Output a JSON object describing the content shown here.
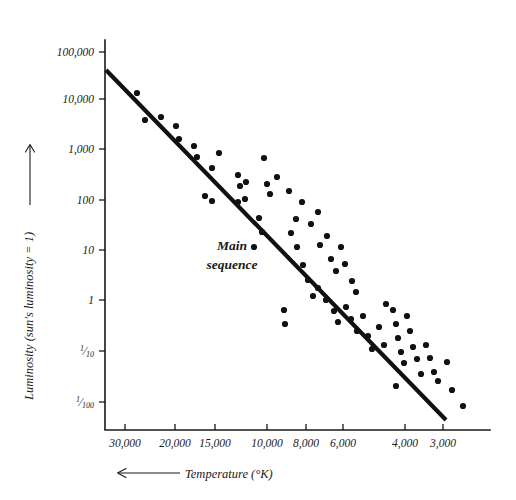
{
  "figure": {
    "background_color": "#ffffff",
    "ink_color": "#111111"
  },
  "annotations": {
    "main_sequence_line1": "Main",
    "main_sequence_line2": "sequence"
  },
  "axis_titles": {
    "y": "Luminosity (sun's luminosity = 1)",
    "x": "Temperature (°K)",
    "y_arrow": "up-arrow",
    "x_arrow": "left-arrow"
  },
  "chart_data": {
    "type": "scatter",
    "title": "",
    "xlabel": "Temperature (°K)",
    "ylabel": "Luminosity (sun's luminosity = 1)",
    "x_axis": {
      "scale": "reversed-nonlinear",
      "tick_labels": [
        "30,000",
        "20,000",
        "15,000",
        "10,000",
        "8,000",
        "6,000",
        "4,000",
        "3,000"
      ],
      "tick_values": [
        30000,
        20000,
        15000,
        10000,
        8000,
        6000,
        4000,
        3000
      ],
      "tick_px": [
        125,
        175,
        215,
        267,
        306,
        343,
        405,
        443
      ],
      "direction": "decreasing left to right",
      "range_px": [
        105,
        490
      ]
    },
    "y_axis": {
      "scale": "log10",
      "tick_labels": [
        "100,000",
        "10,000",
        "1,000",
        "100",
        "10",
        "1",
        "1/10",
        "1/100"
      ],
      "tick_values": [
        100000,
        10000,
        1000,
        100,
        10,
        1,
        0.1,
        0.01
      ],
      "tick_px": [
        52,
        99,
        149,
        200,
        250,
        300,
        351,
        402
      ],
      "range_px": [
        52,
        430
      ]
    },
    "grid": false,
    "legend": false,
    "series": [
      {
        "name": "Main sequence fit line",
        "type": "line",
        "points_px": [
          [
            106,
            70
          ],
          [
            446,
            420
          ]
        ]
      },
      {
        "name": "Stars",
        "type": "scatter",
        "marker": "filled-circle",
        "marker_radius_px": 3.1,
        "points_px": [
          [
            137,
            93
          ],
          [
            145,
            120
          ],
          [
            161,
            117
          ],
          [
            176,
            126
          ],
          [
            179,
            139
          ],
          [
            194,
            146
          ],
          [
            197,
            157
          ],
          [
            212,
            168
          ],
          [
            219,
            153
          ],
          [
            238,
            175
          ],
          [
            240,
            186
          ],
          [
            245,
            199
          ],
          [
            246,
            182
          ],
          [
            205,
            196
          ],
          [
            212,
            201
          ],
          [
            238,
            202
          ],
          [
            264,
            158
          ],
          [
            267,
            184
          ],
          [
            270,
            194
          ],
          [
            277,
            177
          ],
          [
            289,
            191
          ],
          [
            296,
            219
          ],
          [
            291,
            233
          ],
          [
            259,
            218
          ],
          [
            262,
            232
          ],
          [
            254,
            247
          ],
          [
            302,
            202
          ],
          [
            311,
            224
          ],
          [
            318,
            212
          ],
          [
            320,
            245
          ],
          [
            327,
            236
          ],
          [
            331,
            259
          ],
          [
            336,
            271
          ],
          [
            341,
            247
          ],
          [
            345,
            264
          ],
          [
            352,
            281
          ],
          [
            356,
            292
          ],
          [
            297,
            247
          ],
          [
            303,
            265
          ],
          [
            308,
            280
          ],
          [
            313,
            296
          ],
          [
            318,
            288
          ],
          [
            326,
            300
          ],
          [
            334,
            311
          ],
          [
            338,
            322
          ],
          [
            346,
            307
          ],
          [
            351,
            319
          ],
          [
            357,
            331
          ],
          [
            363,
            316
          ],
          [
            368,
            336
          ],
          [
            372,
            349
          ],
          [
            379,
            327
          ],
          [
            384,
            345
          ],
          [
            386,
            304
          ],
          [
            393,
            310
          ],
          [
            396,
            324
          ],
          [
            398,
            338
          ],
          [
            401,
            352
          ],
          [
            404,
            363
          ],
          [
            407,
            316
          ],
          [
            410,
            331
          ],
          [
            413,
            347
          ],
          [
            417,
            359
          ],
          [
            421,
            374
          ],
          [
            426,
            345
          ],
          [
            430,
            358
          ],
          [
            434,
            372
          ],
          [
            438,
            381
          ],
          [
            447,
            362
          ],
          [
            284,
            310
          ],
          [
            285,
            324
          ],
          [
            396,
            386
          ],
          [
            452,
            390
          ],
          [
            463,
            406
          ]
        ]
      }
    ]
  }
}
